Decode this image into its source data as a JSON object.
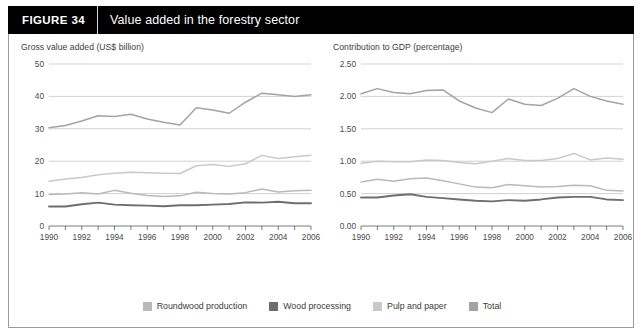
{
  "header": {
    "figure_label": "FIGURE  34",
    "title": "Value added in the forestry sector"
  },
  "legend": [
    {
      "label": "Roundwood production",
      "color": "#b9b9b9"
    },
    {
      "label": "Wood processing",
      "color": "#6e6e6e"
    },
    {
      "label": "Pulp and paper",
      "color": "#c9c9c9"
    },
    {
      "label": "Total",
      "color": "#a3a3a3"
    }
  ],
  "chart_data": [
    {
      "type": "line",
      "id": "gross-value-added",
      "title": "Gross value added (US$ billion)",
      "xlabel": "",
      "ylabel": "Gross value added (US$ billion)",
      "x": [
        1990,
        1991,
        1992,
        1993,
        1994,
        1995,
        1996,
        1997,
        1998,
        1999,
        2000,
        2001,
        2002,
        2003,
        2004,
        2005,
        2006
      ],
      "xlim": [
        1990,
        2006
      ],
      "ylim": [
        0,
        50
      ],
      "yticks": [
        0,
        10,
        20,
        30,
        40,
        50
      ],
      "ytick_labels": [
        "0",
        "10",
        "20",
        "30",
        "40",
        "50"
      ],
      "xticks": [
        1990,
        1991,
        1992,
        1993,
        1994,
        1995,
        1996,
        1997,
        1998,
        1999,
        2000,
        2001,
        2002,
        2003,
        2004,
        2005,
        2006
      ],
      "xtick_labels": [
        "1990",
        "",
        "1992",
        "",
        "1994",
        "",
        "1996",
        "",
        "1998",
        "",
        "2000",
        "",
        "2002",
        "",
        "2004",
        "",
        "2006"
      ],
      "grid": "horizontal",
      "legend_position": "bottom",
      "series": [
        {
          "name": "Total",
          "color": "#a3a3a3",
          "values": [
            30.3,
            31.0,
            32.4,
            34.0,
            33.8,
            34.5,
            33.0,
            32.0,
            31.2,
            36.5,
            35.8,
            34.8,
            38.2,
            41.0,
            40.5,
            40.0,
            40.5
          ]
        },
        {
          "name": "Pulp and paper",
          "color": "#c9c9c9",
          "values": [
            13.8,
            14.5,
            15.0,
            15.8,
            16.3,
            16.6,
            16.4,
            16.3,
            16.2,
            18.6,
            19.0,
            18.4,
            19.2,
            21.8,
            20.8,
            21.4,
            21.8
          ]
        },
        {
          "name": "Roundwood production",
          "color": "#b9b9b9",
          "values": [
            9.7,
            9.9,
            10.3,
            9.9,
            11.0,
            10.1,
            9.4,
            9.1,
            9.3,
            10.4,
            10.0,
            9.9,
            10.3,
            11.4,
            10.5,
            10.9,
            11.0
          ]
        },
        {
          "name": "Wood processing",
          "color": "#6e6e6e",
          "values": [
            6.0,
            6.0,
            6.7,
            7.2,
            6.6,
            6.4,
            6.3,
            6.1,
            6.4,
            6.4,
            6.6,
            6.8,
            7.3,
            7.2,
            7.5,
            7.0,
            7.0
          ]
        }
      ]
    },
    {
      "type": "line",
      "id": "contribution-to-gdp",
      "title": "Contribution to GDP (percentage)",
      "xlabel": "",
      "ylabel": "Contribution to GDP (percentage)",
      "x": [
        1990,
        1991,
        1992,
        1993,
        1994,
        1995,
        1996,
        1997,
        1998,
        1999,
        2000,
        2001,
        2002,
        2003,
        2004,
        2005,
        2006
      ],
      "xlim": [
        1990,
        2006
      ],
      "ylim": [
        0.0,
        2.5
      ],
      "yticks": [
        0.0,
        0.5,
        1.0,
        1.5,
        2.0,
        2.5
      ],
      "ytick_labels": [
        "0.00",
        "0.50",
        "1.00",
        "1.50",
        "2.00",
        "2.50"
      ],
      "xticks": [
        1990,
        1991,
        1992,
        1993,
        1994,
        1995,
        1996,
        1997,
        1998,
        1999,
        2000,
        2001,
        2002,
        2003,
        2004,
        2005,
        2006
      ],
      "xtick_labels": [
        "1990",
        "",
        "1992",
        "",
        "1994",
        "",
        "1996",
        "",
        "1998",
        "",
        "2000",
        "",
        "2002",
        "",
        "2004",
        "",
        "2006"
      ],
      "grid": "horizontal",
      "legend_position": "bottom",
      "series": [
        {
          "name": "Total",
          "color": "#a3a3a3",
          "values": [
            2.04,
            2.12,
            2.06,
            2.04,
            2.09,
            2.1,
            1.93,
            1.82,
            1.75,
            1.96,
            1.88,
            1.86,
            1.97,
            2.12,
            2.0,
            1.93,
            1.88
          ]
        },
        {
          "name": "Pulp and paper",
          "color": "#c9c9c9",
          "values": [
            0.97,
            1.0,
            0.99,
            0.99,
            1.02,
            1.01,
            0.98,
            0.96,
            1.0,
            1.04,
            1.01,
            1.01,
            1.04,
            1.12,
            1.02,
            1.05,
            1.03
          ]
        },
        {
          "name": "Roundwood production",
          "color": "#b9b9b9",
          "values": [
            0.68,
            0.72,
            0.69,
            0.73,
            0.74,
            0.7,
            0.65,
            0.6,
            0.59,
            0.64,
            0.62,
            0.6,
            0.61,
            0.63,
            0.62,
            0.55,
            0.54
          ]
        },
        {
          "name": "Wood processing",
          "color": "#6e6e6e",
          "values": [
            0.44,
            0.44,
            0.47,
            0.49,
            0.45,
            0.43,
            0.41,
            0.39,
            0.38,
            0.4,
            0.39,
            0.41,
            0.44,
            0.45,
            0.45,
            0.41,
            0.4
          ]
        }
      ]
    }
  ]
}
